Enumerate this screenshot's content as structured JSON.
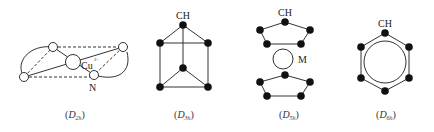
{
  "figure": {
    "panels": [
      {
        "id": "d2h",
        "caption_prefix": "(",
        "caption_main": "D",
        "caption_sub": "2h",
        "caption_suffix": ")",
        "labels": {
          "metal": "Cu",
          "metal_charge": "2+",
          "ligand_atom": "N"
        }
      },
      {
        "id": "d3h",
        "caption_prefix": "(",
        "caption_main": "D",
        "caption_sub": "3h",
        "caption_suffix": ")",
        "labels": {
          "vertex": "CH"
        }
      },
      {
        "id": "d5h",
        "caption_prefix": "(",
        "caption_main": "D",
        "caption_sub": "5h",
        "caption_suffix": ")",
        "labels": {
          "vertex": "CH",
          "metal": "M"
        }
      },
      {
        "id": "d6h",
        "caption_prefix": "(",
        "caption_main": "D",
        "caption_sub": "6h",
        "caption_suffix": ")",
        "labels": {
          "vertex": "CH"
        }
      }
    ],
    "colors": {
      "line": "#333333",
      "node_fill_dark": "#111111",
      "node_fill_open": "#ffffff"
    }
  }
}
